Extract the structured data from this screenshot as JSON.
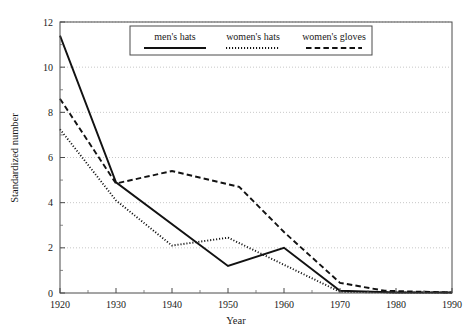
{
  "chart_data": {
    "type": "line",
    "title": "",
    "xlabel": "Year",
    "ylabel": "Standardized number",
    "xlim": [
      1920,
      1990
    ],
    "ylim": [
      0,
      12
    ],
    "xticks": [
      "1920",
      "1930",
      "1940",
      "1950",
      "1960",
      "1970",
      "1980",
      "1990"
    ],
    "yticks": [
      "0",
      "2",
      "4",
      "6",
      "8",
      "10",
      "12"
    ],
    "grid": "horizontal-dotted-at-major-y",
    "legend_position": "top-center-inside",
    "series": [
      {
        "name": "men's hats",
        "style": "solid",
        "color": "#121212",
        "x": [
          1920,
          1930,
          1950,
          1960,
          1970,
          1980,
          1990
        ],
        "values": [
          11.4,
          4.9,
          1.2,
          2.0,
          0.1,
          0.02,
          0.02
        ]
      },
      {
        "name": "women's hats",
        "style": "dotted",
        "color": "#121212",
        "x": [
          1920,
          1930,
          1940,
          1950,
          1960,
          1970,
          1980,
          1990
        ],
        "values": [
          7.25,
          4.1,
          2.1,
          2.45,
          1.25,
          0.05,
          0.02,
          0.02
        ]
      },
      {
        "name": "women's gloves",
        "style": "dashed",
        "color": "#121212",
        "x": [
          1920,
          1930,
          1940,
          1952,
          1960,
          1970,
          1978,
          1990
        ],
        "values": [
          8.6,
          4.85,
          5.4,
          4.7,
          2.7,
          0.45,
          0.1,
          0.02
        ]
      }
    ]
  },
  "legend": {
    "entries": [
      {
        "label": "men's hats",
        "style": "solid"
      },
      {
        "label": "women's hats",
        "style": "dotted"
      },
      {
        "label": "women's gloves",
        "style": "dashed"
      }
    ]
  },
  "axes": {
    "x_title": "Year",
    "y_title": "Standardized number"
  }
}
